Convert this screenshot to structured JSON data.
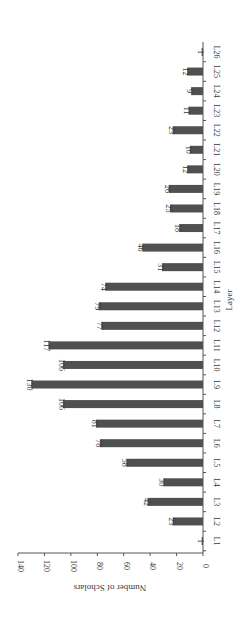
{
  "chart_data": {
    "type": "bar",
    "orientation": "rotated-90",
    "title": "",
    "xlabel": "Layer",
    "ylabel": "Number of Scholars",
    "ylim": [
      0,
      140
    ],
    "yticks": [
      0,
      20,
      40,
      60,
      80,
      100,
      120,
      140
    ],
    "grid": false,
    "legend": null,
    "categories": [
      "L1",
      "L2",
      "L3",
      "L4",
      "L5",
      "L6",
      "L7",
      "L8",
      "L9",
      "L10",
      "L11",
      "L12",
      "L13",
      "L14",
      "L15",
      "L16",
      "L17",
      "L18",
      "L19",
      "L20",
      "L21",
      "L22",
      "L23",
      "L24",
      "L25",
      "L26"
    ],
    "values": [
      1,
      23,
      42,
      30,
      58,
      78,
      81,
      106,
      130,
      106,
      117,
      77,
      79,
      74,
      31,
      46,
      18,
      25,
      26,
      12,
      10,
      23,
      11,
      9,
      12,
      1
    ],
    "data_labels": true,
    "bar_color": "#505050"
  }
}
